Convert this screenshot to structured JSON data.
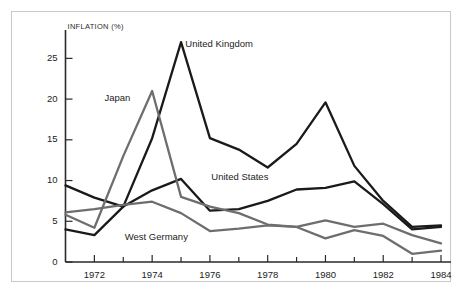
{
  "figure": {
    "y_axis_title": "INFLATION (%)"
  },
  "chart_data": {
    "type": "line",
    "title": "",
    "subtitle": "",
    "xlabel": "",
    "ylabel": "INFLATION (%)",
    "xlim": [
      1971,
      1984
    ],
    "ylim": [
      0,
      27.5
    ],
    "grid": false,
    "legend_position": "inline-labels",
    "x": [
      1971,
      1972,
      1973,
      1974,
      1975,
      1976,
      1977,
      1978,
      1979,
      1980,
      1981,
      1982,
      1983,
      1984
    ],
    "x_tick_labels": [
      "1972",
      "1974",
      "1976",
      "1978",
      "1980",
      "1982",
      "1984"
    ],
    "x_tick_values": [
      1972,
      1974,
      1976,
      1978,
      1980,
      1982,
      1984
    ],
    "y_tick_labels": [
      "0",
      "5",
      "10",
      "15",
      "20",
      "25"
    ],
    "y_tick_values": [
      0,
      5,
      10,
      15,
      20,
      25
    ],
    "series": [
      {
        "name": "United Kingdom",
        "color": "#1a1a1a",
        "label_x": 1975.15,
        "label_y": 26.6,
        "values": [
          4.0,
          3.3,
          6.8,
          15.2,
          27.0,
          15.2,
          13.8,
          11.6,
          14.5,
          19.6,
          11.8,
          7.5,
          4.3,
          4.5
        ]
      },
      {
        "name": "United States",
        "color": "#1a1a1a",
        "label_x": 1976.05,
        "label_y": 10.3,
        "values": [
          9.4,
          7.9,
          6.8,
          8.8,
          10.2,
          6.3,
          6.5,
          7.5,
          8.9,
          9.1,
          9.9,
          7.1,
          4.0,
          4.3
        ]
      },
      {
        "name": "Japan",
        "color": "#6e6e6e",
        "label_x": 1972.35,
        "label_y": 20.0,
        "values": [
          5.8,
          4.2,
          13.0,
          21.0,
          8.0,
          6.8,
          6.0,
          4.6,
          4.3,
          5.1,
          4.3,
          4.7,
          3.3,
          2.3
        ]
      },
      {
        "name": "West Germany",
        "color": "#6e6e6e",
        "label_x": 1973.05,
        "label_y": 2.9,
        "values": [
          6.1,
          6.5,
          7.0,
          7.4,
          6.0,
          3.8,
          4.1,
          4.5,
          4.3,
          2.9,
          3.9,
          3.2,
          1.0,
          1.4
        ]
      }
    ]
  }
}
